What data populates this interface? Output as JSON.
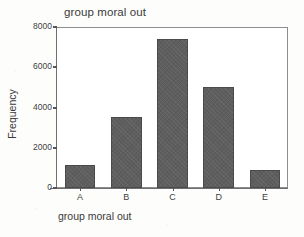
{
  "chart_data": {
    "type": "bar",
    "title": "group moral out",
    "xlabel": "group moral out",
    "ylabel": "Frequency",
    "categories": [
      "A",
      "B",
      "C",
      "D",
      "E"
    ],
    "values": [
      1150,
      3550,
      7400,
      5000,
      900
    ],
    "ylim": [
      0,
      8000
    ],
    "yticks": [
      0,
      2000,
      4000,
      6000,
      8000
    ],
    "ytick_labels": [
      "0",
      "2000",
      "4000",
      "6000",
      "8000"
    ],
    "grid": false,
    "legend": null,
    "bar_color": "#5e5e5e",
    "bar_edge_color": "#4a4a4a",
    "axis_color": "#6f6f6f",
    "background_color": "#ffffff"
  },
  "figure": {
    "title": "group moral out",
    "x_axis_title": "group moral out",
    "y_axis_title": "Frequency"
  }
}
